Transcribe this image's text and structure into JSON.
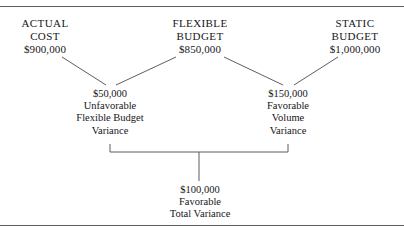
{
  "diagram": {
    "type": "variance-analysis",
    "background_color": "#ffffff",
    "line_color": "#5d5d63",
    "text_color": "#16161a",
    "rules": {
      "top": "horizontal-rule",
      "bottom": "horizontal-rule"
    },
    "columns": [
      {
        "id": "actual-cost",
        "title_line1": "ACTUAL",
        "title_line2": "COST",
        "amount": "$900,000"
      },
      {
        "id": "flexible-budget",
        "title_line1": "FLEXIBLE",
        "title_line2": "BUDGET",
        "amount": "$850,000"
      },
      {
        "id": "static-budget",
        "title_line1": "STATIC",
        "title_line2": "BUDGET",
        "amount": "$1,000,000"
      }
    ],
    "variances": [
      {
        "id": "flexible-budget-variance",
        "amount": "$50,000",
        "direction": "Unfavorable",
        "name_line1": "Flexible Budget",
        "name_line2": "Variance"
      },
      {
        "id": "volume-variance",
        "amount": "$150,000",
        "direction": "Favorable",
        "name_line1": "Volume",
        "name_line2": "Variance"
      }
    ],
    "total": {
      "id": "total-variance",
      "amount": "$100,000",
      "direction": "Favorable",
      "name": "Total Variance"
    }
  }
}
